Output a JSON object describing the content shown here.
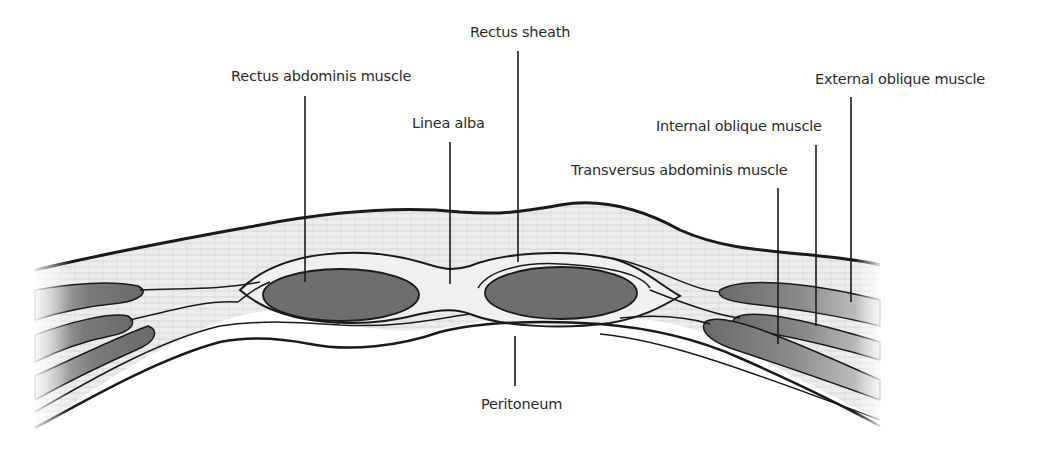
{
  "diagram": {
    "labels": {
      "rectus_sheath": "Rectus sheath",
      "rectus_abdominis": "Rectus abdominis muscle",
      "linea_alba": "Linea alba",
      "external_oblique": "External oblique muscle",
      "internal_oblique": "Internal oblique muscle",
      "transversus_abdominis": "Transversus abdominis muscle",
      "peritoneum": "Peritoneum"
    },
    "colors": {
      "outline": "#1a1a1a",
      "muscle": "#6e6e6e",
      "fascia": "#efefef",
      "subcutaneous": "#e6e6e6",
      "background": "#ffffff"
    }
  }
}
